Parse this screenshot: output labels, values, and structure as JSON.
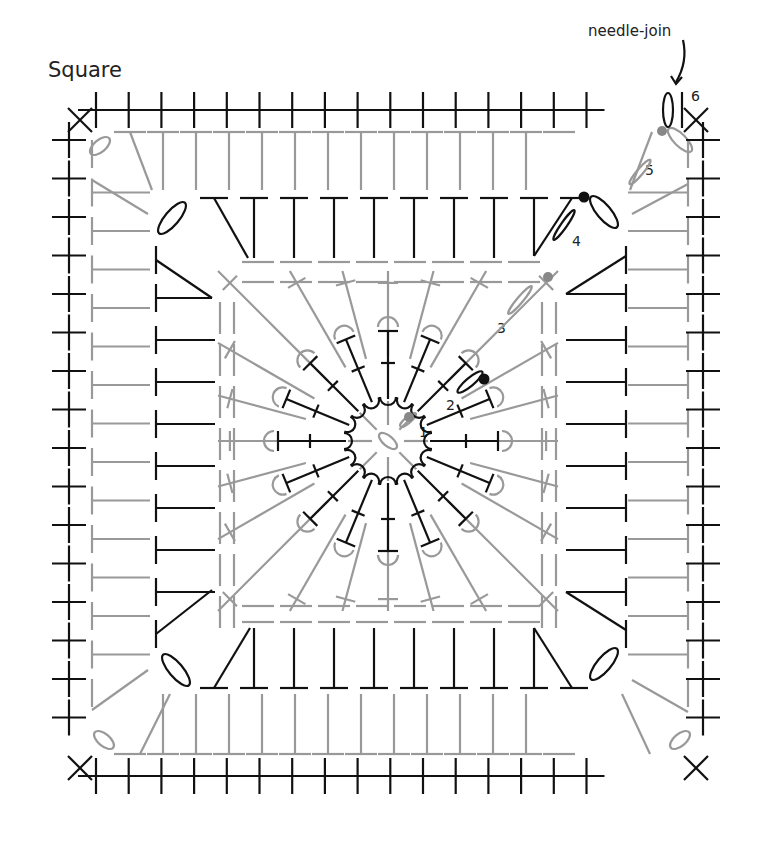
{
  "diagram": {
    "title": "Square",
    "annotation": "needle-join",
    "round_labels": [
      {
        "label": "1",
        "x": 419,
        "y": 424
      },
      {
        "label": "2",
        "x": 446,
        "y": 397
      },
      {
        "label": "3",
        "x": 497,
        "y": 320
      },
      {
        "label": "4",
        "x": 572,
        "y": 233
      },
      {
        "label": "5",
        "x": 645,
        "y": 162
      },
      {
        "label": "6",
        "x": 691,
        "y": 88
      }
    ],
    "colors": {
      "dark": "#111111",
      "gray": "#999999",
      "join_dot": "#888888"
    },
    "legend_symbols": [
      {
        "name": "single-crochet",
        "glyph": "+"
      },
      {
        "name": "slip-stitch-corner",
        "glyph": "×"
      },
      {
        "name": "double-crochet",
        "glyph": "T"
      },
      {
        "name": "chain",
        "glyph": "oval"
      },
      {
        "name": "join-dot",
        "glyph": "●"
      }
    ]
  }
}
